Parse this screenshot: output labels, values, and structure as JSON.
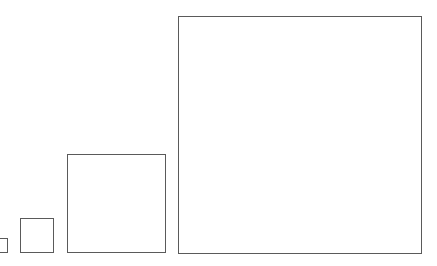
{
  "diagram": {
    "shapes": [
      {
        "type": "square",
        "order": 1,
        "relative_size": "smallest (partially cut off at left edge)"
      },
      {
        "type": "square",
        "order": 2,
        "relative_size": "small"
      },
      {
        "type": "square",
        "order": 3,
        "relative_size": "medium"
      },
      {
        "type": "square",
        "order": 4,
        "relative_size": "largest"
      }
    ],
    "stroke_color": "#5a5a5a",
    "fill_color": "#ffffff",
    "background_color": "#ffffff"
  }
}
